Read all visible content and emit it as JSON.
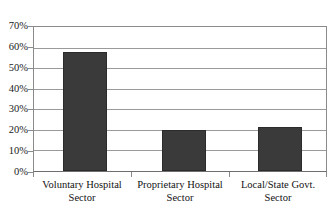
{
  "chart_data": {
    "type": "bar",
    "title": "",
    "subtitle": "",
    "xlabel": "",
    "ylabel": "",
    "categories": [
      "Voluntary Hospital Sector",
      "Proprietary Hospital Sector",
      "Local/State Govt. Sector"
    ],
    "category_lines": [
      [
        "Voluntary Hospital",
        "Sector"
      ],
      [
        "Proprietary Hospital",
        "Sector"
      ],
      [
        "Local/State Govt.",
        "Sector"
      ]
    ],
    "values": [
      58,
      19.8,
      21.5
    ],
    "value_labels": [
      "58%",
      "20%",
      "21%"
    ],
    "ylim": [
      0,
      70
    ],
    "ytick_values": [
      0,
      10,
      20,
      30,
      40,
      50,
      60,
      70
    ],
    "ytick_labels": [
      "0%",
      "10%",
      "20%",
      "30%",
      "40%",
      "50%",
      "60%",
      "70%"
    ],
    "grid": true,
    "grid_axis": "y",
    "legend": false,
    "legend_position": "none",
    "series": [
      {
        "name": "Share",
        "values": [
          58,
          19.8,
          21.5
        ]
      }
    ],
    "colors": {
      "bar_fill": "#3a3a3a",
      "bar_border": "#2b2b2b",
      "gridline": "#9a9a9a",
      "axis": "#8a8a8a",
      "background": "#ffffff",
      "text": "#121212"
    }
  }
}
